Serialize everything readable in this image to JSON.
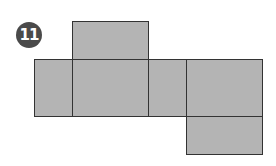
{
  "figure": {
    "badge_number": "11",
    "colors": {
      "face_fill": "#b4b4b4",
      "edge": "#333333",
      "badge": "#4a4a4a"
    },
    "faces": [
      {
        "id": "top",
        "x": 72,
        "y": 21,
        "w": 77,
        "h": 38
      },
      {
        "id": "left",
        "x": 34,
        "y": 59,
        "w": 38,
        "h": 57
      },
      {
        "id": "front",
        "x": 72,
        "y": 59,
        "w": 77,
        "h": 57
      },
      {
        "id": "right",
        "x": 148,
        "y": 59,
        "w": 38,
        "h": 57
      },
      {
        "id": "back",
        "x": 186,
        "y": 59,
        "w": 76,
        "h": 57
      },
      {
        "id": "bottom",
        "x": 186,
        "y": 116,
        "w": 76,
        "h": 38
      }
    ]
  }
}
